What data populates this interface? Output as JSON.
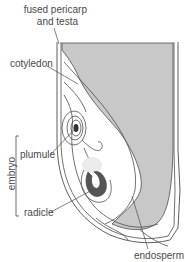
{
  "diagram": {
    "labels": {
      "pericarp_line1": "fused pericarp",
      "pericarp_line2": "and testa",
      "cotyledon": "cotyledon",
      "embryo": "embryo",
      "plumule": "plumule",
      "radicle": "radicle",
      "endosperm": "endosperm"
    },
    "colors": {
      "outline": "#4d4d4d",
      "endosperm_fill": "#c8c8c8",
      "radicle_fill": "#555555",
      "highlight": "#ebebeb",
      "text": "#4a4a4a"
    }
  }
}
